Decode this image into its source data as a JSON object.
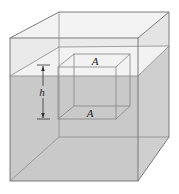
{
  "diagram": {
    "colors": {
      "water": "#c9c9c9",
      "water_side": "#d0d0d0",
      "water_surface": "#f2f2f2",
      "air": "#ececec",
      "air_side": "#e2e2e2",
      "edge": "#7a7a7a",
      "inner_edge": "#8a8a8a",
      "label": "#222222"
    },
    "labels": {
      "top_face": "A",
      "bottom_face": "A",
      "depth": "h"
    },
    "elements": [
      {
        "name": "container",
        "shape": "rectangular box"
      },
      {
        "name": "fluid",
        "description": "fluid filling container up to surface level"
      },
      {
        "name": "submerged-cube",
        "description": "cube of area A at top and bottom faces"
      },
      {
        "name": "depth-dimension",
        "description": "height h of submerged cube"
      }
    ]
  }
}
